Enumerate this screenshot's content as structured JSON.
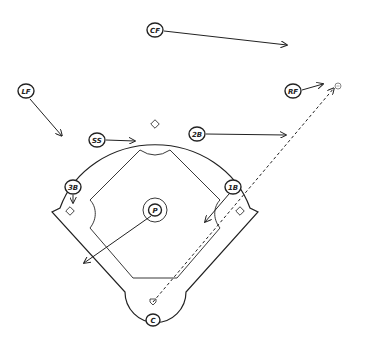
{
  "diagram": {
    "type": "baseball-field-defensive-positioning",
    "background_color": "#ffffff",
    "line_color": "#222222",
    "positions": [
      {
        "id": "cf",
        "label": "CF",
        "x": 155,
        "y": 30
      },
      {
        "id": "lf",
        "label": "LF",
        "x": 26,
        "y": 91
      },
      {
        "id": "rf",
        "label": "RF",
        "x": 293,
        "y": 91
      },
      {
        "id": "ss",
        "label": "SS",
        "x": 97,
        "y": 140
      },
      {
        "id": "2b",
        "label": "2B",
        "x": 197,
        "y": 134
      },
      {
        "id": "3b",
        "label": "3B",
        "x": 73,
        "y": 187
      },
      {
        "id": "1b",
        "label": "1B",
        "x": 233,
        "y": 187
      },
      {
        "id": "p",
        "label": "P",
        "x": 155,
        "y": 210
      },
      {
        "id": "c",
        "label": "C",
        "x": 153,
        "y": 320
      }
    ],
    "movement_arrows": [
      {
        "from": "cf",
        "to": [
          287,
          45
        ]
      },
      {
        "from": "lf",
        "to": [
          62,
          136
        ]
      },
      {
        "from": "rf",
        "to": [
          323,
          84
        ]
      },
      {
        "from": "ss",
        "to": [
          135,
          141
        ]
      },
      {
        "from": "2b",
        "to": [
          286,
          135
        ]
      },
      {
        "from": "3b",
        "to": [
          73,
          203
        ]
      },
      {
        "from": "1b",
        "to": [
          205,
          222
        ]
      },
      {
        "from": "p",
        "to": [
          84,
          263
        ]
      }
    ],
    "ball_path": {
      "style": "dashed",
      "from": [
        153,
        302
      ],
      "to": [
        336,
        86
      ]
    },
    "ball_marker": {
      "x": 338,
      "y": 86
    },
    "bases": {
      "second": {
        "x": 155,
        "y": 124
      },
      "third": {
        "x": 70,
        "y": 211
      },
      "first": {
        "x": 240,
        "y": 211
      },
      "home": {
        "x": 153,
        "y": 302
      }
    }
  }
}
